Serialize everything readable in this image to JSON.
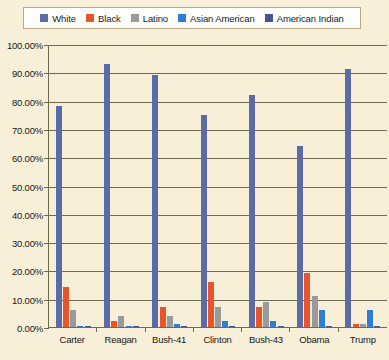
{
  "legend": {
    "position": "top",
    "items": [
      {
        "label": "White",
        "color": "#5b6ba8",
        "icon": "legend-swatch-icon"
      },
      {
        "label": "Black",
        "color": "#e8552d",
        "icon": "legend-swatch-icon"
      },
      {
        "label": "Latino",
        "color": "#9a9a9a",
        "icon": "legend-swatch-icon"
      },
      {
        "label": "Asian American",
        "color": "#2e7fd4",
        "icon": "legend-swatch-icon"
      },
      {
        "label": "American Indian",
        "color": "#48548f",
        "icon": "legend-swatch-icon"
      }
    ]
  },
  "axis": {
    "y_ticks": [
      "100.00%",
      "90.00%",
      "80.00%",
      "70.00%",
      "60.00%",
      "50.00%",
      "40.00%",
      "30.00%",
      "20.00%",
      "10.00%",
      "0.00%"
    ],
    "x_ticks": [
      "Carter",
      "Reagan",
      "Bush-41",
      "Clinton",
      "Bush-43",
      "Obama",
      "Trump"
    ]
  },
  "colors": {
    "background": "#f7efd8",
    "legend_background": "#fdfdfb",
    "legend_border": "#b9ab86",
    "axis": "#6e6a52",
    "text": "#181818"
  },
  "chart_data": {
    "type": "bar",
    "title": "",
    "subtitle": "",
    "xlabel": "",
    "ylabel": "",
    "ylim": [
      0,
      100
    ],
    "ytick_step": 10,
    "grid": true,
    "legend_position": "top",
    "categories": [
      "Carter",
      "Reagan",
      "Bush-41",
      "Clinton",
      "Bush-43",
      "Obama",
      "Trump"
    ],
    "series": [
      {
        "name": "White",
        "color": "#5b6ba8",
        "values": [
          78.0,
          93.0,
          89.0,
          75.0,
          82.0,
          64.0,
          91.0
        ]
      },
      {
        "name": "Black",
        "color": "#e8552d",
        "values": [
          14.0,
          2.0,
          7.0,
          16.0,
          7.0,
          19.0,
          1.0
        ]
      },
      {
        "name": "Latino",
        "color": "#9a9a9a",
        "values": [
          6.0,
          4.0,
          4.0,
          7.0,
          9.0,
          11.0,
          1.0
        ]
      },
      {
        "name": "Asian American",
        "color": "#2e7fd4",
        "values": [
          0.5,
          0.5,
          1.0,
          2.0,
          2.0,
          6.0,
          6.0
        ]
      },
      {
        "name": "American Indian",
        "color": "#48548f",
        "values": [
          0.3,
          0.3,
          0.3,
          0.3,
          0.3,
          0.3,
          0.3
        ]
      }
    ]
  }
}
